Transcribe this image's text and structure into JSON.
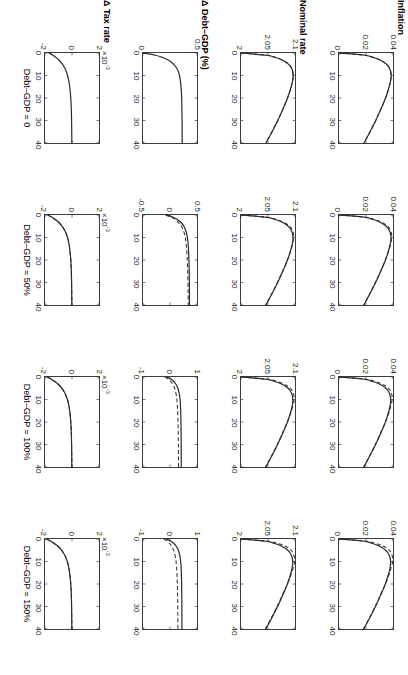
{
  "figure": {
    "title": "",
    "layout": "4 rows x 4 columns of line plots, figure rotated 90 degrees clockwise",
    "background_color": "#ffffff",
    "line_color": "#2b2b2b",
    "axis_color": "#3c3c3c"
  },
  "rows": [
    {
      "label": "Inflation",
      "exponent": "",
      "yticks": [
        "0.04",
        "0.02",
        "0"
      ]
    },
    {
      "label": "Nominal rate",
      "exponent": "",
      "yticks": [
        "2.1",
        "2.05",
        "2"
      ]
    },
    {
      "label": "Δ Debt–GDP (%)",
      "exponent": "",
      "yticks": []
    },
    {
      "label": "Δ Tax rate",
      "exponent": "×10",
      "exponent_sup": "-3",
      "yticks": [
        "2",
        "0",
        "-2"
      ]
    }
  ],
  "columns": [
    {
      "label": "Debt–GDP = 0"
    },
    {
      "label": "Debt–GDP = 50%"
    },
    {
      "label": "Debt–GDP = 100%"
    },
    {
      "label": "Debt–GDP = 150%"
    }
  ],
  "xaxis": {
    "ticks": [
      "0",
      "10",
      "20",
      "30",
      "40"
    ],
    "min": 0,
    "max": 40
  },
  "chart_data": {
    "type": "line",
    "title": "",
    "xlabel": "",
    "ylabel": "",
    "grid": false,
    "legend": "none",
    "x": [
      0,
      1,
      2,
      3,
      4,
      5,
      6,
      8,
      10,
      12,
      15,
      20,
      25,
      30,
      35,
      40
    ],
    "xlim": [
      0,
      40
    ],
    "panels": [
      {
        "row": "Inflation",
        "column": "Debt–GDP = 0",
        "ylim": [
          0,
          0.04
        ],
        "yticks": [
          0,
          0.02,
          0.04
        ],
        "series": [
          {
            "name": "solid",
            "style": "solid",
            "values": [
              0.0,
              0.0193,
              0.0255,
              0.03,
              0.033,
              0.0352,
              0.0367,
              0.0382,
              0.0386,
              0.0383,
              0.0372,
              0.0345,
              0.031,
              0.0272,
              0.023,
              0.0185
            ]
          },
          {
            "name": "dashed",
            "style": "dashed",
            "values": [
              0.0,
              0.0193,
              0.0255,
              0.03,
              0.033,
              0.0352,
              0.0367,
              0.0382,
              0.0386,
              0.0383,
              0.0372,
              0.0345,
              0.031,
              0.0272,
              0.023,
              0.0185
            ]
          }
        ]
      },
      {
        "row": "Inflation",
        "column": "Debt–GDP = 50%",
        "ylim": [
          0,
          0.04
        ],
        "yticks": [
          0,
          0.02,
          0.04
        ],
        "series": [
          {
            "name": "solid",
            "style": "solid",
            "values": [
              0.0,
              0.019,
              0.0252,
              0.0297,
              0.0327,
              0.0349,
              0.0364,
              0.038,
              0.0385,
              0.0382,
              0.0371,
              0.0344,
              0.0309,
              0.0271,
              0.0229,
              0.0184
            ]
          },
          {
            "name": "dashed",
            "style": "dashed",
            "values": [
              0.0,
              0.0196,
              0.0262,
              0.0308,
              0.0338,
              0.036,
              0.0374,
              0.0388,
              0.0391,
              0.0386,
              0.0373,
              0.0344,
              0.0308,
              0.027,
              0.0228,
              0.0183
            ]
          }
        ]
      },
      {
        "row": "Inflation",
        "column": "Debt–GDP = 100%",
        "ylim": [
          0,
          0.04
        ],
        "yticks": [
          0,
          0.02,
          0.04
        ],
        "series": [
          {
            "name": "solid",
            "style": "solid",
            "values": [
              0.0,
              0.0188,
              0.025,
              0.0295,
              0.0325,
              0.0347,
              0.0362,
              0.0378,
              0.0383,
              0.0381,
              0.037,
              0.0344,
              0.0309,
              0.0271,
              0.0229,
              0.0184
            ]
          },
          {
            "name": "dashed",
            "style": "dashed",
            "values": [
              0.0,
              0.02,
              0.0268,
              0.0315,
              0.0345,
              0.0366,
              0.038,
              0.0392,
              0.0394,
              0.0388,
              0.0374,
              0.0344,
              0.0307,
              0.0269,
              0.0227,
              0.0182
            ]
          }
        ]
      },
      {
        "row": "Inflation",
        "column": "Debt–GDP = 150%",
        "ylim": [
          0,
          0.04
        ],
        "yticks": [
          0,
          0.02,
          0.04
        ],
        "series": [
          {
            "name": "solid",
            "style": "solid",
            "values": [
              0.0,
              0.0186,
              0.0248,
              0.0293,
              0.0323,
              0.0345,
              0.036,
              0.0377,
              0.0382,
              0.038,
              0.037,
              0.0343,
              0.0308,
              0.027,
              0.0228,
              0.0183
            ]
          },
          {
            "name": "dashed",
            "style": "dashed",
            "values": [
              0.0,
              0.0205,
              0.0274,
              0.0322,
              0.0352,
              0.0372,
              0.0385,
              0.0396,
              0.0397,
              0.039,
              0.0375,
              0.0344,
              0.0306,
              0.0268,
              0.0226,
              0.0181
            ]
          }
        ]
      },
      {
        "row": "Nominal rate",
        "column": "Debt–GDP = 0",
        "ylim": [
          2.0,
          2.1
        ],
        "yticks": [
          2.0,
          2.05,
          2.1
        ],
        "series": [
          {
            "name": "solid",
            "style": "solid",
            "values": [
              2.0,
              2.048,
              2.064,
              2.0752,
              2.0826,
              2.088,
              2.0918,
              2.0955,
              2.0966,
              2.0958,
              2.093,
              2.0862,
              2.0775,
              2.068,
              2.0575,
              2.0462
            ]
          },
          {
            "name": "dashed",
            "style": "dashed",
            "values": [
              2.0,
              2.048,
              2.064,
              2.0752,
              2.0826,
              2.088,
              2.0918,
              2.0955,
              2.0966,
              2.0958,
              2.093,
              2.0862,
              2.0775,
              2.068,
              2.0575,
              2.0462
            ]
          }
        ]
      },
      {
        "row": "Nominal rate",
        "column": "Debt–GDP = 50%",
        "ylim": [
          2.0,
          2.1
        ],
        "yticks": [
          2.0,
          2.05,
          2.1
        ],
        "series": [
          {
            "name": "solid",
            "style": "solid",
            "values": [
              2.0,
              2.0475,
              2.0633,
              2.0745,
              2.082,
              2.0874,
              2.0912,
              2.0951,
              2.0963,
              2.0956,
              2.0928,
              2.0861,
              2.0774,
              2.0679,
              2.0574,
              2.0461
            ]
          },
          {
            "name": "dashed",
            "style": "dashed",
            "values": [
              2.0,
              2.049,
              2.0656,
              2.077,
              2.0845,
              2.0898,
              2.0934,
              2.0968,
              2.0976,
              2.0964,
              2.0932,
              2.086,
              2.077,
              2.0674,
              2.0569,
              2.0456
            ]
          }
        ]
      },
      {
        "row": "Nominal rate",
        "column": "Debt–GDP = 100%",
        "ylim": [
          2.0,
          2.1
        ],
        "yticks": [
          2.0,
          2.05,
          2.1
        ],
        "series": [
          {
            "name": "solid",
            "style": "solid",
            "values": [
              2.0,
              2.047,
              2.0628,
              2.074,
              2.0815,
              2.087,
              2.0908,
              2.0948,
              2.096,
              2.0954,
              2.0927,
              2.086,
              2.0773,
              2.0678,
              2.0573,
              2.046
            ]
          },
          {
            "name": "dashed",
            "style": "dashed",
            "values": [
              2.0,
              2.05,
              2.067,
              2.0786,
              2.086,
              2.0912,
              2.0947,
              2.0978,
              2.0984,
              2.097,
              2.0935,
              2.0859,
              2.0767,
              2.0671,
              2.0566,
              2.0453
            ]
          }
        ]
      },
      {
        "row": "Nominal rate",
        "column": "Debt–GDP = 150%",
        "ylim": [
          2.0,
          2.1
        ],
        "yticks": [
          2.0,
          2.05,
          2.1
        ],
        "series": [
          {
            "name": "solid",
            "style": "solid",
            "values": [
              2.0,
              2.0465,
              2.0622,
              2.0735,
              2.081,
              2.0865,
              2.0904,
              2.0945,
              2.0958,
              2.0952,
              2.0926,
              2.0859,
              2.0772,
              2.0677,
              2.0572,
              2.0459
            ]
          },
          {
            "name": "dashed",
            "style": "dashed",
            "values": [
              2.0,
              2.0512,
              2.0686,
              2.0804,
              2.0878,
              2.0928,
              2.0961,
              2.0989,
              2.0993,
              2.0977,
              2.0939,
              2.0859,
              2.0764,
              2.0667,
              2.0562,
              2.0449
            ]
          }
        ]
      },
      {
        "row": "Δ Debt–GDP (%)",
        "column": "Debt–GDP = 0",
        "ylim": [
          0,
          0.5
        ],
        "yticks": [
          0,
          0.5
        ],
        "series": [
          {
            "name": "solid",
            "style": "solid",
            "values": [
              0.0,
              0.115,
              0.182,
              0.228,
              0.261,
              0.284,
              0.302,
              0.325,
              0.338,
              0.345,
              0.352,
              0.358,
              0.36,
              0.362,
              0.362,
              0.363
            ]
          }
        ]
      },
      {
        "row": "Δ Debt–GDP (%)",
        "column": "Debt–GDP = 50%",
        "ylim": [
          -0.5,
          0.5
        ],
        "yticks": [
          -0.5,
          0,
          0.5
        ],
        "series": [
          {
            "name": "solid",
            "style": "solid",
            "values": [
              -0.06,
              0.06,
              0.136,
              0.19,
              0.228,
              0.256,
              0.277,
              0.305,
              0.322,
              0.332,
              0.342,
              0.351,
              0.356,
              0.359,
              0.36,
              0.361
            ]
          },
          {
            "name": "dashed",
            "style": "dashed",
            "values": [
              -0.085,
              0.02,
              0.092,
              0.144,
              0.182,
              0.211,
              0.233,
              0.263,
              0.282,
              0.294,
              0.307,
              0.32,
              0.328,
              0.333,
              0.336,
              0.338
            ]
          }
        ]
      },
      {
        "row": "Δ Debt–GDP (%)",
        "column": "Debt–GDP = 100%",
        "ylim": [
          -1,
          1
        ],
        "yticks": [
          -1,
          0,
          1
        ],
        "series": [
          {
            "name": "solid",
            "style": "solid",
            "values": [
              -0.12,
              0.04,
              0.14,
              0.208,
              0.256,
              0.291,
              0.317,
              0.352,
              0.372,
              0.385,
              0.396,
              0.406,
              0.411,
              0.414,
              0.416,
              0.417
            ]
          },
          {
            "name": "dashed",
            "style": "dashed",
            "values": [
              -0.19,
              -0.06,
              0.028,
              0.09,
              0.136,
              0.17,
              0.196,
              0.232,
              0.254,
              0.268,
              0.283,
              0.297,
              0.305,
              0.31,
              0.313,
              0.315
            ]
          }
        ]
      },
      {
        "row": "Δ Debt–GDP (%)",
        "column": "Debt–GDP = 150%",
        "ylim": [
          -1,
          1
        ],
        "yticks": [
          -1,
          0,
          1
        ],
        "series": [
          {
            "name": "solid",
            "style": "solid",
            "values": [
              -0.145,
              0.035,
              0.145,
              0.218,
              0.27,
              0.308,
              0.336,
              0.374,
              0.396,
              0.409,
              0.421,
              0.431,
              0.436,
              0.439,
              0.441,
              0.442
            ]
          },
          {
            "name": "dashed",
            "style": "dashed",
            "values": [
              -0.235,
              -0.105,
              -0.015,
              0.05,
              0.098,
              0.134,
              0.162,
              0.2,
              0.224,
              0.24,
              0.256,
              0.272,
              0.281,
              0.287,
              0.29,
              0.292
            ]
          }
        ]
      },
      {
        "row": "Δ Tax rate",
        "column": "Debt–GDP = 0",
        "ylim": [
          -2,
          2
        ],
        "yticks": [
          -2,
          0,
          2
        ],
        "scale": 0.001,
        "series": [
          {
            "name": "solid",
            "style": "solid",
            "values": [
              -1.7,
              -1.42,
              -1.18,
              -0.99,
              -0.84,
              -0.71,
              -0.6,
              -0.44,
              -0.33,
              -0.25,
              -0.17,
              -0.09,
              -0.05,
              -0.03,
              -0.02,
              -0.01
            ]
          }
        ]
      },
      {
        "row": "Δ Tax rate",
        "column": "Debt–GDP = 50%",
        "ylim": [
          -2,
          2
        ],
        "yticks": [
          -2,
          0,
          2
        ],
        "scale": 0.001,
        "series": [
          {
            "name": "solid",
            "style": "solid",
            "values": [
              -1.78,
              -1.48,
              -1.23,
              -1.03,
              -0.87,
              -0.74,
              -0.62,
              -0.45,
              -0.33,
              -0.25,
              -0.17,
              -0.09,
              -0.05,
              -0.03,
              -0.02,
              -0.01
            ]
          },
          {
            "name": "dashed",
            "style": "dashed",
            "values": [
              -1.8,
              -1.5,
              -1.25,
              -1.05,
              -0.88,
              -0.75,
              -0.63,
              -0.46,
              -0.34,
              -0.25,
              -0.17,
              -0.09,
              -0.05,
              -0.03,
              -0.02,
              -0.01
            ]
          }
        ]
      },
      {
        "row": "Δ Tax rate",
        "column": "Debt–GDP = 100%",
        "ylim": [
          -2,
          2
        ],
        "yticks": [
          -2,
          0,
          2
        ],
        "scale": 0.001,
        "series": [
          {
            "name": "solid",
            "style": "solid",
            "values": [
              -1.84,
              -1.53,
              -1.27,
              -1.06,
              -0.89,
              -0.75,
              -0.63,
              -0.46,
              -0.34,
              -0.25,
              -0.17,
              -0.09,
              -0.05,
              -0.03,
              -0.02,
              -0.01
            ]
          },
          {
            "name": "dashed",
            "style": "dashed",
            "values": [
              -1.86,
              -1.55,
              -1.29,
              -1.08,
              -0.91,
              -0.77,
              -0.65,
              -0.47,
              -0.35,
              -0.26,
              -0.18,
              -0.09,
              -0.05,
              -0.03,
              -0.02,
              -0.01
            ]
          }
        ]
      },
      {
        "row": "Δ Tax rate",
        "column": "Debt–GDP = 150%",
        "ylim": [
          -2,
          2
        ],
        "yticks": [
          -2,
          0,
          2
        ],
        "scale": 0.001,
        "series": [
          {
            "name": "solid",
            "style": "solid",
            "values": [
              -1.88,
              -1.56,
              -1.3,
              -1.08,
              -0.91,
              -0.77,
              -0.65,
              -0.47,
              -0.35,
              -0.26,
              -0.18,
              -0.09,
              -0.05,
              -0.03,
              -0.02,
              -0.01
            ]
          },
          {
            "name": "dashed",
            "style": "dashed",
            "values": [
              -1.9,
              -1.58,
              -1.32,
              -1.1,
              -0.93,
              -0.78,
              -0.66,
              -0.48,
              -0.36,
              -0.26,
              -0.18,
              -0.09,
              -0.05,
              -0.03,
              -0.02,
              -0.01
            ]
          }
        ]
      }
    ]
  }
}
